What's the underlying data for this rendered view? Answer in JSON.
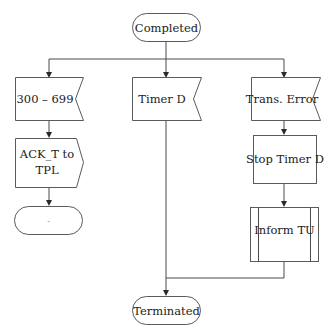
{
  "diagram": {
    "type": "flowchart",
    "nodes": {
      "completed": {
        "label": "Completed",
        "shape": "terminal"
      },
      "resp_300_699": {
        "label": "300 – 699",
        "shape": "receive-signal"
      },
      "timer_d": {
        "label": "Timer D",
        "shape": "receive-signal"
      },
      "trans_error": {
        "label": "Trans. Error",
        "shape": "receive-signal"
      },
      "ack_to_tpl": {
        "label_line1": "ACK_T to",
        "label_line2": "TPL",
        "shape": "send-signal"
      },
      "stop_timer_d": {
        "label": "Stop Timer D",
        "shape": "process"
      },
      "inform_tu": {
        "label": "Inform TU",
        "shape": "predefined-process"
      },
      "dash_terminal": {
        "label": "-",
        "shape": "terminal"
      },
      "terminated": {
        "label": "Terminated",
        "shape": "terminal"
      }
    },
    "edges": [
      {
        "from": "Completed",
        "to": "300 – 699"
      },
      {
        "from": "Completed",
        "to": "Timer D"
      },
      {
        "from": "Completed",
        "to": "Trans. Error"
      },
      {
        "from": "300 – 699",
        "to": "ACK_T to TPL"
      },
      {
        "from": "ACK_T to TPL",
        "to": "-"
      },
      {
        "from": "Timer D",
        "to": "Terminated"
      },
      {
        "from": "Trans. Error",
        "to": "Stop Timer D"
      },
      {
        "from": "Stop Timer D",
        "to": "Inform TU"
      },
      {
        "from": "Inform TU",
        "to": "Terminated"
      }
    ]
  }
}
